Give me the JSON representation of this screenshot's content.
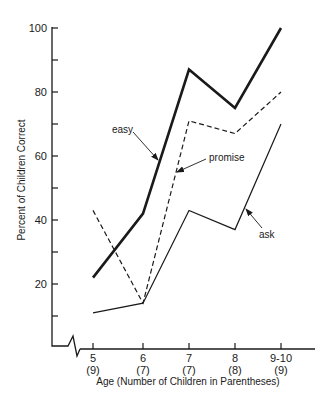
{
  "chart_data": {
    "type": "line",
    "title": "",
    "xlabel": "Age (Number of Children in Parentheses)",
    "ylabel": "Percent of Children Correct",
    "categories": [
      "5",
      "6",
      "7",
      "8",
      "9-10"
    ],
    "category_counts": [
      "(9)",
      "(7)",
      "(7)",
      "(8)",
      "(9)"
    ],
    "yticks": [
      20,
      40,
      60,
      80,
      100
    ],
    "yminor_ticks": [
      10,
      30,
      50,
      70,
      90
    ],
    "ylim": [
      0,
      100
    ],
    "grid": false,
    "legend": "inline labels with arrows",
    "axis_break": "x-axis break near origin",
    "series": [
      {
        "name": "easy",
        "style": "thick-solid",
        "values": [
          22,
          42,
          87,
          75,
          100
        ]
      },
      {
        "name": "promise",
        "style": "dashed",
        "values": [
          43,
          14,
          71,
          67,
          80
        ]
      },
      {
        "name": "ask",
        "style": "thin-solid",
        "values": [
          11,
          14,
          43,
          37,
          70
        ]
      }
    ],
    "annotations": [
      {
        "text": "easy",
        "series": "easy"
      },
      {
        "text": "promise",
        "series": "promise"
      },
      {
        "text": "ask",
        "series": "ask"
      }
    ]
  },
  "colors": {
    "ink": "#1a1a1a",
    "background": "#ffffff"
  }
}
